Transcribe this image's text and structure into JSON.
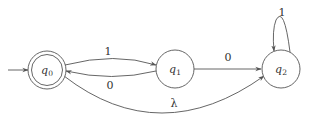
{
  "diagram": {
    "type": "finite-automaton",
    "states": [
      {
        "id": "q0",
        "name": "q",
        "sub": "0",
        "start": true,
        "accepting": true
      },
      {
        "id": "q1",
        "name": "q",
        "sub": "1",
        "start": false,
        "accepting": false
      },
      {
        "id": "q2",
        "name": "q",
        "sub": "2",
        "start": false,
        "accepting": false
      }
    ],
    "transitions": [
      {
        "from": "q0",
        "to": "q1",
        "label": "1"
      },
      {
        "from": "q1",
        "to": "q0",
        "label": "0"
      },
      {
        "from": "q1",
        "to": "q2",
        "label": "0"
      },
      {
        "from": "q2",
        "to": "q2",
        "label": "1"
      },
      {
        "from": "q0",
        "to": "q2",
        "label": "λ"
      }
    ],
    "colors": {
      "stroke": "#555555",
      "text": "#333333",
      "background": "#ffffff"
    }
  }
}
